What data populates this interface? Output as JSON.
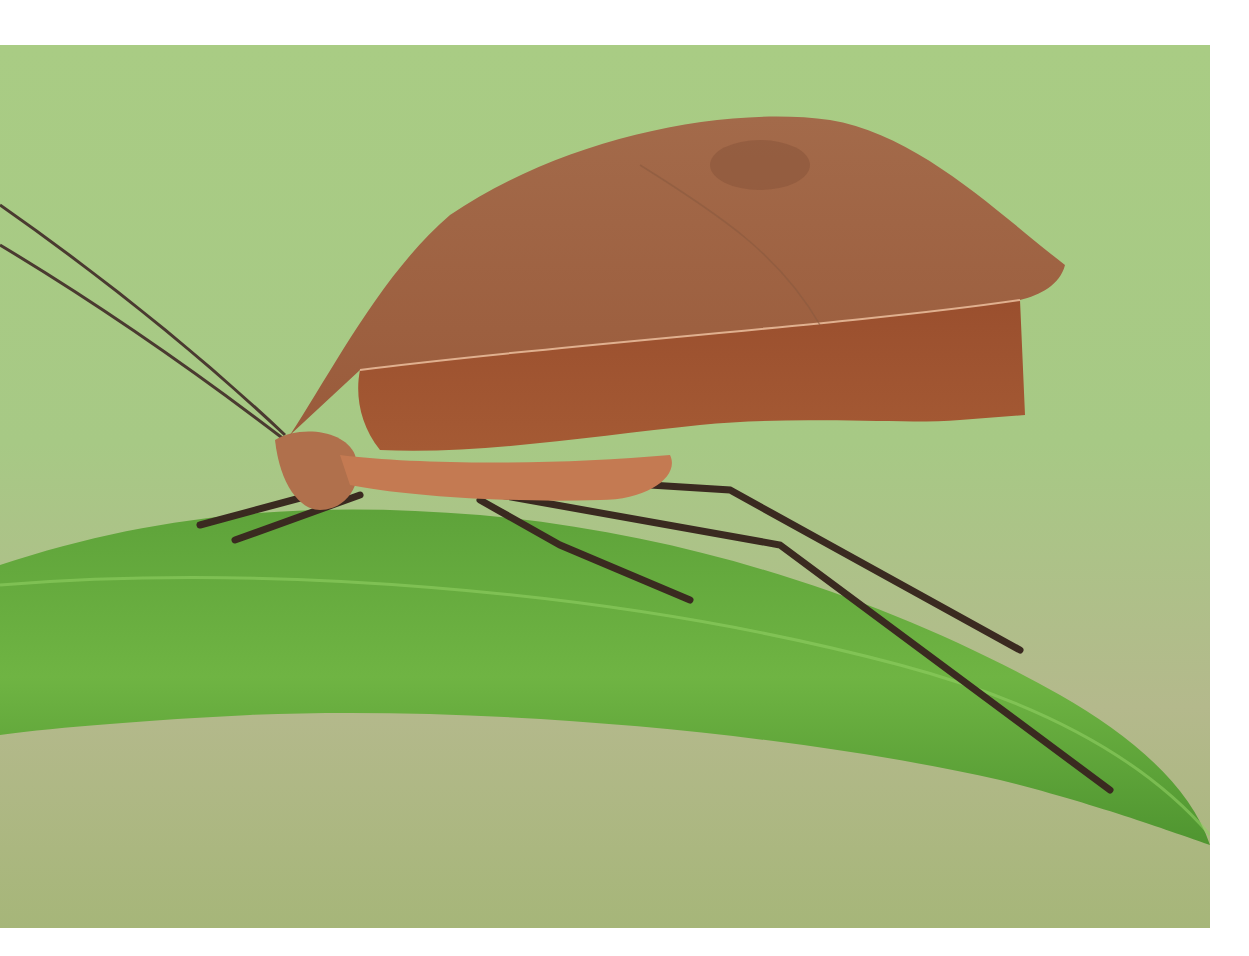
{
  "image": {
    "subject": "Dead-leaf mimic katydid on a green leaf",
    "alt": "Close-up photo of a brown leaf-mimicking katydid with long antennae and thin legs standing on a bright green leaf against a soft green background",
    "colors": {
      "background_top": "#a9cc84",
      "background_bottom": "#a8b27a",
      "leaf": "#5fa83a",
      "leaf_highlight": "#86c45a",
      "insect_body": "#a8643e",
      "insect_dark": "#7a3f22",
      "legs": "#3a2a20",
      "page": "#ffffff"
    }
  }
}
